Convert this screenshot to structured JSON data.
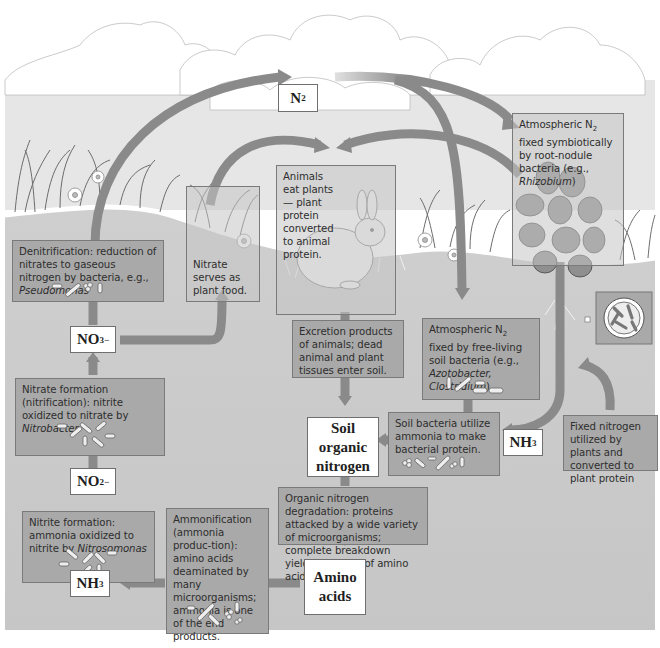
{
  "diagram": {
    "colors": {
      "sky": "#ffffff",
      "soil": "#c8c8c8",
      "box_fill": "#a9a9a9",
      "arrow": "#8a8a8a",
      "label_box": "#ffffff"
    },
    "nodes": {
      "n2": {
        "symbol": "N",
        "sub": "2"
      },
      "no3": {
        "symbol": "NO",
        "sub": "3",
        "sup": "−"
      },
      "no2": {
        "symbol": "NO",
        "sub": "2",
        "sup": "−"
      },
      "nh3_left": {
        "symbol": "NH",
        "sub": "3"
      },
      "nh3_right": {
        "symbol": "NH",
        "sub": "3"
      },
      "soil_organic_nitrogen": {
        "line1": "Soil",
        "line2": "organic",
        "line3": "nitrogen"
      },
      "amino_acids": {
        "line1": "Amino",
        "line2": "acids"
      }
    },
    "boxes": {
      "denitrification": {
        "text": "Denitrification: reduction of nitrates to gaseous nitrogen by bacteria, e.g., ",
        "organism": "Pseudomonas"
      },
      "nitrate_plant_food": {
        "text": "Nitrate serves as plant food."
      },
      "animals_eat_plants": {
        "text": "Animals eat plants — plant protein converted to animal protein."
      },
      "symbiotic_fixation": {
        "text_a": "Atmospheric N",
        "sub": "2",
        "text_b": " fixed symbiotically by root-nodule bacteria (e.g., ",
        "organism": "Rhizobium",
        "text_c": ")"
      },
      "free_living_fixation": {
        "text_a": "Atmospheric N",
        "sub": "2",
        "text_b": " fixed by free-living soil bacteria (e.g., ",
        "organism": "Azotobacter, Clostridium",
        "text_c": ")"
      },
      "excretion": {
        "text": "Excretion products of animals; dead animal and plant tissues enter soil."
      },
      "soil_bacteria_ammonia": {
        "text": "Soil bacteria utilize ammonia to make bacterial protein."
      },
      "fixed_nitrogen_plants": {
        "text": "Fixed nitrogen utilized by plants and converted to plant protein"
      },
      "nitrification": {
        "text": "Nitrate formation (nitrification): nitrite oxidized to nitrate by ",
        "organism": "Nitrobacter"
      },
      "nitrite_formation": {
        "text": "Nitrite formation: ammonia oxidized to nitrite by ",
        "organism": "Nitrosomonas"
      },
      "ammonification": {
        "text": "Ammonification (ammonia produc-tion): amino acids deaminated by many microorganisms; ammonia is one of the end products."
      },
      "organic_degradation": {
        "text": "Organic nitrogen degradation: proteins attacked by a wide variety of microorganisms; complete breakdown yields mixtures of amino acids."
      }
    },
    "icons": [
      "cloud-icon",
      "grass-icon",
      "flower-icon",
      "rabbit-icon",
      "legume-plant-icon",
      "root-nodule-icon",
      "bacteria-icon",
      "arrow-icon"
    ]
  }
}
